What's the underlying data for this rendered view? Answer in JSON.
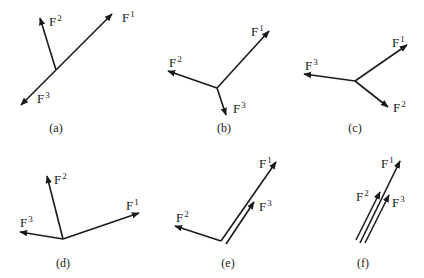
{
  "figure": {
    "panels": [
      {
        "caption": "(a)",
        "caption_pos": [
          56,
          132
        ],
        "vectors": [
          {
            "name": "F",
            "index": "1",
            "from": [
              56,
              70
            ],
            "to": [
              112,
              14
            ],
            "label_pos": [
              122,
              22
            ]
          },
          {
            "name": "F",
            "index": "2",
            "from": [
              56,
              70
            ],
            "to": [
              40,
              18
            ],
            "label_pos": [
              49,
              26
            ]
          },
          {
            "name": "F",
            "index": "3",
            "from": [
              56,
              70
            ],
            "to": [
              21,
              105
            ],
            "label_pos": [
              37,
              103
            ]
          }
        ]
      },
      {
        "caption": "(b)",
        "caption_pos": [
          224,
          132
        ],
        "vectors": [
          {
            "name": "F",
            "index": "1",
            "from": [
              217,
              88
            ],
            "to": [
              269,
              31
            ],
            "label_pos": [
              251,
              36
            ]
          },
          {
            "name": "F",
            "index": "2",
            "from": [
              217,
              88
            ],
            "to": [
              168,
              71
            ],
            "label_pos": [
              169,
              67
            ]
          },
          {
            "name": "F",
            "index": "3",
            "from": [
              217,
              88
            ],
            "to": [
              226,
              115
            ],
            "label_pos": [
              233,
              113
            ]
          }
        ]
      },
      {
        "caption": "(c)",
        "caption_pos": [
          355,
          132
        ],
        "vectors": [
          {
            "name": "F",
            "index": "1",
            "from": [
              355,
              81
            ],
            "to": [
              407,
              45
            ],
            "label_pos": [
              392,
              47
            ]
          },
          {
            "name": "F",
            "index": "2",
            "from": [
              355,
              81
            ],
            "to": [
              388,
              107
            ],
            "label_pos": [
              393,
              112
            ]
          },
          {
            "name": "F",
            "index": "3",
            "from": [
              355,
              81
            ],
            "to": [
              304,
              74
            ],
            "label_pos": [
              305,
              70
            ]
          }
        ]
      },
      {
        "caption": "(d)",
        "caption_pos": [
          63,
          267
        ],
        "vectors": [
          {
            "name": "F",
            "index": "1",
            "from": [
              63,
              239
            ],
            "to": [
              139,
              213
            ],
            "label_pos": [
              126,
              210
            ]
          },
          {
            "name": "F",
            "index": "2",
            "from": [
              63,
              239
            ],
            "to": [
              47,
              176
            ],
            "label_pos": [
              54,
              184
            ]
          },
          {
            "name": "F",
            "index": "3",
            "from": [
              63,
              239
            ],
            "to": [
              20,
              232
            ],
            "label_pos": [
              20,
              227
            ]
          }
        ]
      },
      {
        "caption": "(e)",
        "caption_pos": [
          228,
          267
        ],
        "vectors": [
          {
            "name": "F",
            "index": "1",
            "from": [
              221,
              241
            ],
            "to": [
              276,
              162
            ],
            "label_pos": [
              259,
              168
            ]
          },
          {
            "name": "F",
            "index": "2",
            "from": [
              221,
              241
            ],
            "to": [
              175,
              226
            ],
            "label_pos": [
              176,
              222
            ]
          },
          {
            "name": "F",
            "index": "3",
            "from": [
              226,
              244
            ],
            "to": [
              254,
              202
            ],
            "label_pos": [
              259,
              211
            ]
          }
        ]
      },
      {
        "caption": "(f)",
        "caption_pos": [
          363,
          267
        ],
        "vectors": [
          {
            "name": "F",
            "index": "1",
            "from": [
              360,
              243
            ],
            "to": [
              400,
              161
            ],
            "label_pos": [
              381,
              168
            ]
          },
          {
            "name": "F",
            "index": "2",
            "from": [
              356,
              240
            ],
            "to": [
              380,
              192
            ],
            "label_pos": [
              356,
              201
            ]
          },
          {
            "name": "F",
            "index": "3",
            "from": [
              365,
              243
            ],
            "to": [
              389,
              195
            ],
            "label_pos": [
              392,
              207
            ]
          }
        ]
      }
    ]
  },
  "labels": {
    "a": "(a)",
    "b": "(b)",
    "c": "(c)",
    "d": "(d)",
    "e": "(e)",
    "f": "(f)",
    "force_symbol": "F",
    "i1": "1",
    "i2": "2",
    "i3": "3"
  }
}
